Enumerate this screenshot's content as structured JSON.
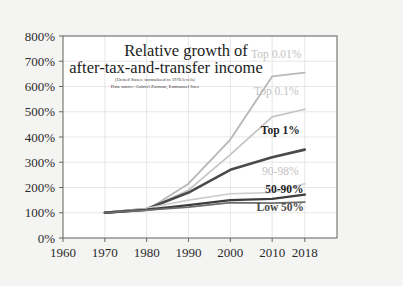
{
  "figure": {
    "background_color": "#f4f4f2",
    "plot_background_color": "#ffffff"
  },
  "chart_data": {
    "type": "line",
    "title": "Relative growth of after-tax-and-transfer income",
    "title_line1": "Relative growth of",
    "title_line2": "after-tax-and-transfer income",
    "subtitle_line1": "(United States;  normalized to 1970 levels)",
    "subtitle_line2": "Data source: Gabriel Zucman, Emmanuel Saez",
    "xlabel": "",
    "ylabel": "",
    "x": [
      1960,
      1970,
      1980,
      1990,
      2000,
      2010,
      2018
    ],
    "xtick_labels": [
      "1960",
      "1970",
      "1980",
      "1990",
      "2000",
      "2010",
      "2018"
    ],
    "ytick_labels": [
      "0%",
      "100%",
      "200%",
      "300%",
      "400%",
      "500%",
      "600%",
      "700%",
      "800%"
    ],
    "ytick_values": [
      0,
      100,
      200,
      300,
      400,
      500,
      600,
      700,
      800
    ],
    "ylim": [
      0,
      800
    ],
    "xlim": [
      1960,
      2018
    ],
    "grid": true,
    "legend_position": "inline-right",
    "series": [
      {
        "name": "Top 0.01%",
        "label": "Top 0.01%",
        "color": "#b9b9b9",
        "width": 1.9,
        "label_style": "light",
        "x": [
          1970,
          1980,
          1990,
          2000,
          2010,
          2018
        ],
        "values": [
          100,
          110,
          215,
          390,
          640,
          655
        ],
        "label_x": 2011,
        "label_y": 712
      },
      {
        "name": "Top 0.1%",
        "label": "Top 0.1%",
        "color": "#c4c4c4",
        "width": 1.7,
        "label_style": "light",
        "x": [
          1970,
          1980,
          1990,
          2000,
          2010,
          2018
        ],
        "values": [
          100,
          112,
          190,
          330,
          480,
          510
        ],
        "label_x": 2011,
        "label_y": 565
      },
      {
        "name": "Top 1%",
        "label": "Top 1%",
        "color": "#4a4a4a",
        "width": 2.6,
        "label_style": "dark",
        "x": [
          1970,
          1980,
          1990,
          2000,
          2010,
          2018
        ],
        "values": [
          100,
          115,
          180,
          270,
          320,
          350
        ],
        "label_x": 2012,
        "label_y": 412
      },
      {
        "name": "90-98%",
        "label": "90-98%",
        "color": "#cccccc",
        "width": 1.6,
        "label_style": "light",
        "x": [
          1970,
          1980,
          1990,
          2000,
          2010,
          2018
        ],
        "values": [
          100,
          118,
          150,
          175,
          180,
          215
        ],
        "label_x": 2012,
        "label_y": 248
      },
      {
        "name": "50-90%",
        "label": "50-90%",
        "color": "#3d3d3d",
        "width": 2.4,
        "label_style": "dark",
        "x": [
          1970,
          1980,
          1990,
          2000,
          2010,
          2018
        ],
        "values": [
          100,
          112,
          130,
          150,
          155,
          172
        ],
        "label_x": 2013,
        "label_y": 178
      },
      {
        "name": "Low 50%",
        "label": "Low 50%",
        "color": "#6e6e6e",
        "width": 1.7,
        "label_style": "mid",
        "x": [
          1970,
          1980,
          1990,
          2000,
          2010,
          2018
        ],
        "values": [
          100,
          110,
          122,
          140,
          138,
          142
        ],
        "label_x": 2012,
        "label_y": 108
      }
    ]
  }
}
